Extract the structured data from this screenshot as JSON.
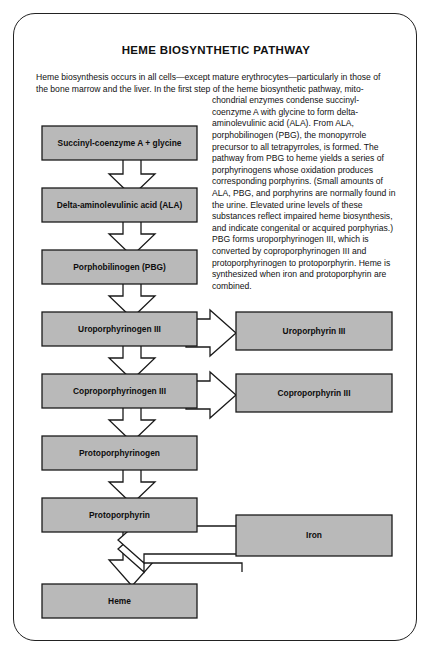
{
  "title": "HEME BIOSYNTHETIC PATHWAY",
  "intro": {
    "line_full_1": "Heme biosynthesis occurs in all cells—except mature erythrocytes—particularly in those of",
    "line_full_2": "the bone marrow and the liver. In the first step of the heme biosynthetic pathway, mito-",
    "wrapped": "chondrial enzymes condense succinyl-coenzyme A with glycine to form delta-aminolevulinic acid (ALA). From ALA, porphobilinogen (PBG), the monopyrrole precursor to all tetrapyrroles, is formed. The pathway from PBG to heme yields a series of porphyrinogens whose oxidation produces corresponding porphyrins. (Small amounts of ALA, PBG, and porphyrins are normally found in the urine. Elevated urine levels of these substances reflect impaired heme biosynthesis, and indicate congenital or acquired porphyrias.) PBG forms uroporphyrinogen III, which is converted by coproporphyrinogen III and protoporphyrinogen to protoporphyrin. Heme is synthesized when iron and protoporphyrin are combined."
  },
  "colors": {
    "box_fill": "#b9b9b9",
    "box_stroke": "#1a1a1a",
    "arrow_fill": "#ffffff",
    "card_border": "#222222",
    "text": "#0d0d0d"
  },
  "pathway": {
    "main_chain": [
      {
        "id": "succinyl",
        "label": "Succinyl-coenzyme A  +  glycine"
      },
      {
        "id": "ala",
        "label": "Delta-aminolevulinic acid (ALA)"
      },
      {
        "id": "pbg",
        "label": "Porphobilinogen (PBG)"
      },
      {
        "id": "uroporphyrinogen-iii",
        "label": "Uroporphyrinogen III"
      },
      {
        "id": "coproporphyrinogen-iii",
        "label": "Coproporphyrinogen III"
      },
      {
        "id": "protoporphyrinogen",
        "label": "Protoporphyrinogen"
      },
      {
        "id": "protoporphyrin",
        "label": "Protoporphyrin"
      },
      {
        "id": "heme",
        "label": "Heme"
      }
    ],
    "branch_products": [
      {
        "id": "uroporphyrin-iii",
        "label": "Uroporphyrin III",
        "from": "uroporphyrinogen-iii"
      },
      {
        "id": "coproporphyrin-iii",
        "label": "Coproporphyrin III",
        "from": "coproporphyrinogen-iii"
      }
    ],
    "inputs": [
      {
        "id": "iron",
        "label": "Iron",
        "into": "heme"
      }
    ],
    "arrow_count_down": 7,
    "arrow_count_right": 2,
    "arrow_count_left": 1
  }
}
